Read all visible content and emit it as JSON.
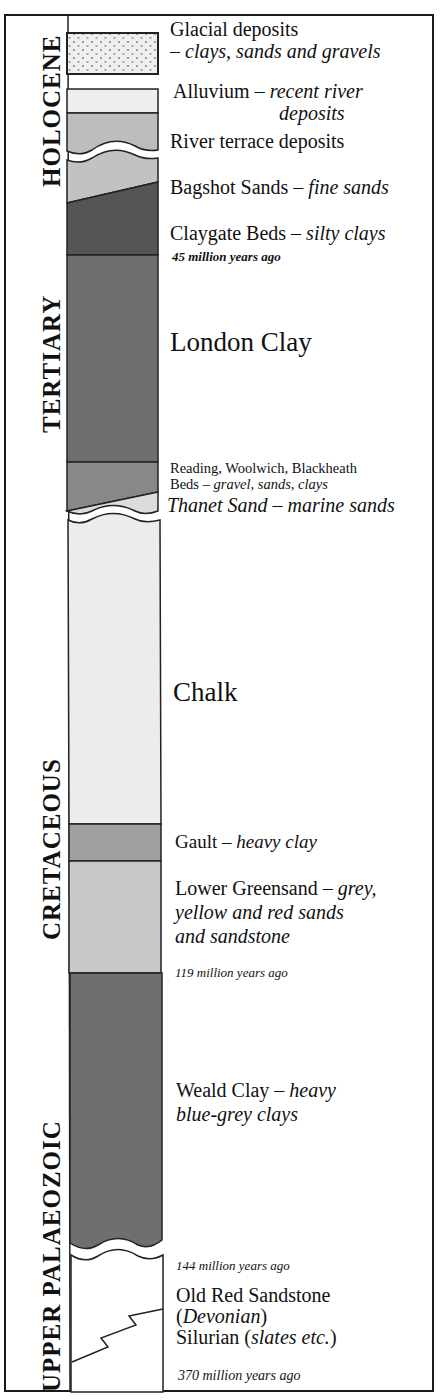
{
  "eras": [
    {
      "label": "HOLOCENE"
    },
    {
      "label": "TERTIARY"
    },
    {
      "label": "CRETACEOUS"
    },
    {
      "label": "UPPER PALAEOZOIC"
    }
  ],
  "layers": {
    "glacial": {
      "name": "Glacial deposits",
      "desc": "– clays, sands and gravels",
      "color": "#e6e6e6"
    },
    "alluvium": {
      "name": "Alluvium – ",
      "desc": "recent river",
      "desc2": "deposits",
      "color": "#eeeeee"
    },
    "river_terrace": {
      "name": "River terrace deposits",
      "color": "#bdbdbd"
    },
    "bagshot": {
      "name": "Bagshot Sands – ",
      "desc": "fine sands",
      "color": "#c2c2c2"
    },
    "claygate": {
      "name": "Claygate Beds – ",
      "desc": "silty clays",
      "color": "#555555"
    },
    "london_clay": {
      "name": "London Clay",
      "color": "#6e6e6e"
    },
    "reading": {
      "name": "Reading, Woolwich, Blackheath",
      "name2": "Beds – ",
      "desc": "gravel, sands, clays",
      "color": "#888888"
    },
    "thanet": {
      "name": "Thanet Sand – marine sands",
      "color": "#dcdcdc"
    },
    "chalk": {
      "name": "Chalk",
      "color": "#ececec"
    },
    "gault": {
      "name": "Gault – ",
      "desc": "heavy clay",
      "color": "#a0a0a0"
    },
    "lower_greensand": {
      "name": "Lower Greensand – ",
      "desc": "grey,",
      "desc2": "yellow and red sands",
      "desc3": "and sandstone",
      "color": "#c8c8c8"
    },
    "weald_clay": {
      "name": "Weald Clay – ",
      "desc": "heavy",
      "desc2": "blue-grey clays",
      "color": "#6f6f6f"
    },
    "old_red": {
      "name": "Old Red Sandstone",
      "paren_open": "(",
      "desc": "Devonian",
      "paren_close": ")",
      "color": "#ffffff"
    },
    "silurian": {
      "name": "Silurian (",
      "desc": "slates etc.",
      "close": ")"
    }
  },
  "ages": {
    "a45": "45 million years ago",
    "a119": "119 million years ago",
    "a144": "144 million years ago",
    "a370": "370 million years ago"
  }
}
